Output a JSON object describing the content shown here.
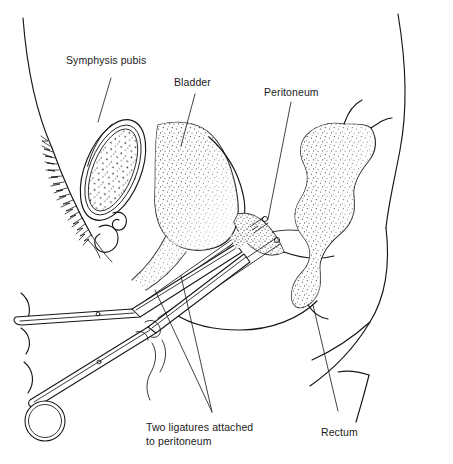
{
  "figure": {
    "background_color": "#ffffff",
    "ink_color": "#15151a",
    "width": 453,
    "height": 464
  },
  "labels": {
    "symphysis_pubis": "Symphysis pubis",
    "bladder": "Bladder",
    "peritoneum": "Peritoneum",
    "rectum": "Rectum",
    "ligatures_line1": "Two ligatures attached",
    "ligatures_line2": "to peritoneum"
  },
  "structures": [
    {
      "name": "abdominal-wall",
      "label": ""
    },
    {
      "name": "symphysis-pubis",
      "label": "Symphysis pubis"
    },
    {
      "name": "bladder",
      "label": "Bladder"
    },
    {
      "name": "peritoneum",
      "label": "Peritoneum"
    },
    {
      "name": "rectum",
      "label": "Rectum"
    },
    {
      "name": "ligature-threads",
      "label": "Two ligatures attached to peritoneum"
    },
    {
      "name": "surgical-forceps",
      "label": ""
    },
    {
      "name": "pubic-hair",
      "label": ""
    },
    {
      "name": "buttock-outline",
      "label": ""
    }
  ]
}
